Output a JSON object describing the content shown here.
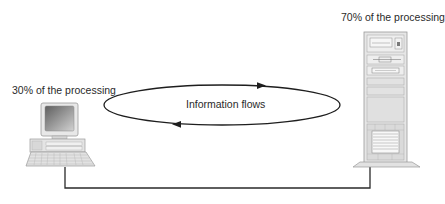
{
  "diagram": {
    "client": {
      "label": "30% of the processing",
      "icon": "desktop-computer-icon",
      "share_percent": 30
    },
    "server": {
      "label": "70% of the processing",
      "icon": "server-tower-icon",
      "share_percent": 70
    },
    "flow": {
      "label": "Information flows",
      "directions": [
        "client-to-server",
        "server-to-client"
      ]
    },
    "colors": {
      "line": "#1e1e1e",
      "device_fill": "#e4e4e4",
      "device_stroke": "#9a9a9a",
      "screen_dark": "#6e6e6e",
      "screen_light": "#c8c8c8",
      "text": "#2a2a2a"
    }
  }
}
